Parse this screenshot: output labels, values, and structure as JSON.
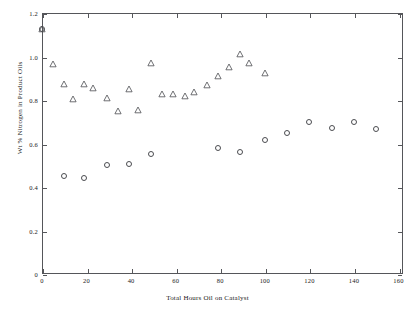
{
  "chart_data": {
    "type": "scatter",
    "title": "",
    "xlabel": "Total Hours Oil on Catalyst",
    "ylabel": "Wt % Nitrogen in Product Oils",
    "xlim": [
      0,
      162
    ],
    "ylim": [
      0,
      1.2
    ],
    "xticks": [
      0,
      20,
      40,
      60,
      80,
      100,
      120,
      140,
      160
    ],
    "xticklabels": [
      "0",
      "20",
      "40",
      "60",
      "80",
      "100",
      "120",
      "140",
      "160"
    ],
    "yticks": [
      0,
      0.2,
      0.4,
      0.6,
      0.8,
      1.0,
      1.2
    ],
    "yticklabels": [
      "0",
      "0.2",
      "0.4",
      "0.6",
      "0.8",
      "1.0",
      "1.2"
    ],
    "grid": false,
    "legend": "none",
    "marker_color": "#4b4c50",
    "axis_color": "#55565a",
    "background": "#ffffff",
    "series": [
      {
        "name": "Triangles",
        "marker": "triangle",
        "points": [
          [
            0,
            1.125
          ],
          [
            5,
            0.965
          ],
          [
            10,
            0.875
          ],
          [
            14,
            0.805
          ],
          [
            19,
            0.872
          ],
          [
            23,
            0.855
          ],
          [
            29,
            0.808
          ],
          [
            34,
            0.748
          ],
          [
            39,
            0.852
          ],
          [
            43,
            0.755
          ],
          [
            49,
            0.968
          ],
          [
            54,
            0.828
          ],
          [
            59,
            0.827
          ],
          [
            64,
            0.818
          ],
          [
            68,
            0.838
          ],
          [
            74,
            0.868
          ],
          [
            79,
            0.912
          ],
          [
            84,
            0.952
          ],
          [
            89,
            1.012
          ],
          [
            93,
            0.972
          ],
          [
            100,
            0.925
          ]
        ]
      },
      {
        "name": "Circles",
        "marker": "circle",
        "points": [
          [
            0,
            1.125
          ],
          [
            10,
            0.452
          ],
          [
            19,
            0.44
          ],
          [
            29,
            0.502
          ],
          [
            39,
            0.505
          ],
          [
            49,
            0.553
          ],
          [
            79,
            0.58
          ],
          [
            89,
            0.56
          ],
          [
            100,
            0.618
          ],
          [
            110,
            0.648
          ],
          [
            120,
            0.698
          ],
          [
            130,
            0.672
          ],
          [
            140,
            0.7
          ],
          [
            150,
            0.665
          ]
        ]
      }
    ]
  }
}
